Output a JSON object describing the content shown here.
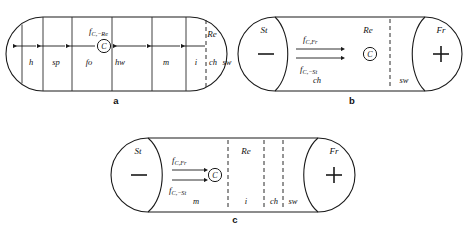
{
  "figure": {
    "background_color": "#ffffff",
    "line_color": "#1a1a1a"
  },
  "panels": [
    {
      "id": "a",
      "letter": "a",
      "shape": "stadium",
      "compartments": [
        {
          "key": "h",
          "label": "h"
        },
        {
          "key": "sp",
          "label": "sp"
        },
        {
          "key": "fo",
          "label": "fo"
        },
        {
          "key": "hw",
          "label": "hw"
        },
        {
          "key": "m",
          "label": "m"
        },
        {
          "key": "i",
          "label": "i"
        },
        {
          "key": "ch",
          "label": "ch"
        },
        {
          "key": "sw",
          "label": "sw"
        }
      ],
      "top_labels": [
        {
          "key": "Re",
          "label": "Re"
        }
      ],
      "center_marker": "C",
      "fluxes": [
        {
          "key": "f_C_minus_Re",
          "base": "f",
          "sub": "C,−Re",
          "direction": "left"
        }
      ],
      "arrow_direction": "left",
      "arrow_count": 6
    },
    {
      "id": "b",
      "letter": "b",
      "shape": "stadium",
      "compartments": [
        {
          "key": "ch",
          "label": "ch"
        },
        {
          "key": "sw",
          "label": "sw"
        }
      ],
      "top_labels": [
        {
          "key": "St",
          "label": "St"
        },
        {
          "key": "Re",
          "label": "Re"
        },
        {
          "key": "Fr",
          "label": "Fr"
        }
      ],
      "signs": [
        {
          "key": "minus",
          "glyph": "−",
          "side": "left"
        },
        {
          "key": "plus",
          "glyph": "+",
          "side": "right"
        }
      ],
      "center_marker": "C",
      "fluxes": [
        {
          "key": "f_C_Fr",
          "base": "f",
          "sub": "C,Fr",
          "direction": "right"
        },
        {
          "key": "f_C_minus_St",
          "base": "f",
          "sub": "C,−St",
          "direction": "right"
        }
      ],
      "arrow_direction": "right",
      "arrow_count": 2
    },
    {
      "id": "c",
      "letter": "c",
      "shape": "stadium",
      "compartments": [
        {
          "key": "m",
          "label": "m"
        },
        {
          "key": "i",
          "label": "i"
        },
        {
          "key": "ch",
          "label": "ch"
        },
        {
          "key": "sw",
          "label": "sw"
        }
      ],
      "top_labels": [
        {
          "key": "St",
          "label": "St"
        },
        {
          "key": "Re",
          "label": "Re"
        },
        {
          "key": "Fr",
          "label": "Fr"
        }
      ],
      "signs": [
        {
          "key": "minus",
          "glyph": "−",
          "side": "left"
        },
        {
          "key": "plus",
          "glyph": "+",
          "side": "right"
        }
      ],
      "center_marker": "C",
      "fluxes": [
        {
          "key": "f_C_Fr",
          "base": "f",
          "sub": "C,Fr",
          "direction": "right"
        },
        {
          "key": "f_C_minus_St",
          "base": "f",
          "sub": "C,−St",
          "direction": "right"
        }
      ],
      "arrow_direction": "right",
      "arrow_count": 2
    }
  ]
}
